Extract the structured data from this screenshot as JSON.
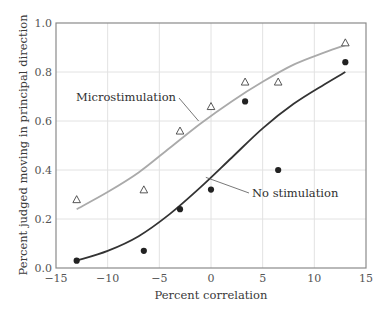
{
  "chart_data": {
    "type": "scatter",
    "title": "",
    "xlabel": "Percent correlation",
    "ylabel": "Percent judged moving in principal direction",
    "xlim": [
      -15,
      15
    ],
    "ylim": [
      0.0,
      1.0
    ],
    "xticks": [
      -15,
      -10,
      -5,
      0,
      5,
      10,
      15
    ],
    "xtick_labels": [
      "−15",
      "−10",
      "−5",
      "0",
      "5",
      "10",
      "15"
    ],
    "yticks": [
      0.0,
      0.2,
      0.4,
      0.6,
      0.8,
      1.0
    ],
    "ytick_labels": [
      "0.0",
      "0.2",
      "0.4",
      "0.6",
      "0.8",
      "1.0"
    ],
    "grid": true,
    "legend": "none",
    "series": [
      {
        "name": "Microstimulation",
        "marker": "open-triangle",
        "color": "#aaaaaa",
        "marker_color": "#444444",
        "points": [
          {
            "x": -13,
            "y": 0.28
          },
          {
            "x": -6.5,
            "y": 0.32
          },
          {
            "x": -3,
            "y": 0.56
          },
          {
            "x": 0,
            "y": 0.66
          },
          {
            "x": 3.3,
            "y": 0.76
          },
          {
            "x": 6.5,
            "y": 0.76
          },
          {
            "x": 13,
            "y": 0.92
          }
        ],
        "fit": [
          {
            "x": -13,
            "y": 0.24
          },
          {
            "x": -10,
            "y": 0.31
          },
          {
            "x": -7,
            "y": 0.39
          },
          {
            "x": -4,
            "y": 0.49
          },
          {
            "x": -1,
            "y": 0.59
          },
          {
            "x": 2,
            "y": 0.68
          },
          {
            "x": 5,
            "y": 0.76
          },
          {
            "x": 8,
            "y": 0.83
          },
          {
            "x": 11,
            "y": 0.88
          },
          {
            "x": 13,
            "y": 0.91
          }
        ],
        "annotation": {
          "text": "Microstimulation",
          "anchor": {
            "x": -1.2,
            "y": 0.6
          }
        }
      },
      {
        "name": "No stimulation",
        "marker": "filled-circle",
        "color": "#333333",
        "marker_color": "#222222",
        "points": [
          {
            "x": -13,
            "y": 0.03
          },
          {
            "x": -6.5,
            "y": 0.07
          },
          {
            "x": -3,
            "y": 0.24
          },
          {
            "x": 0,
            "y": 0.32
          },
          {
            "x": 3.3,
            "y": 0.68
          },
          {
            "x": 6.5,
            "y": 0.4
          },
          {
            "x": 13,
            "y": 0.84
          }
        ],
        "fit": [
          {
            "x": -13,
            "y": 0.03
          },
          {
            "x": -10,
            "y": 0.07
          },
          {
            "x": -7,
            "y": 0.13
          },
          {
            "x": -4,
            "y": 0.22
          },
          {
            "x": -1,
            "y": 0.33
          },
          {
            "x": 2,
            "y": 0.45
          },
          {
            "x": 5,
            "y": 0.57
          },
          {
            "x": 8,
            "y": 0.67
          },
          {
            "x": 11,
            "y": 0.75
          },
          {
            "x": 13,
            "y": 0.8
          }
        ],
        "annotation": {
          "text": "No stimulation",
          "anchor": {
            "x": -0.5,
            "y": 0.37
          }
        }
      }
    ]
  }
}
